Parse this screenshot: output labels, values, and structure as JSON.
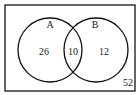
{
  "diagram": {
    "type": "venn",
    "sets": [
      {
        "name": "A",
        "only": "26"
      },
      {
        "name": "B",
        "only": "12"
      }
    ],
    "intersection": "10",
    "outside": "52"
  }
}
